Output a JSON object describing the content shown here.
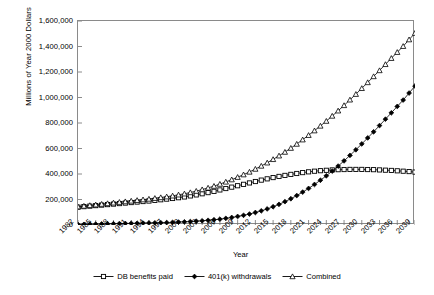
{
  "chart_data": {
    "type": "line",
    "title": "",
    "xlabel": "Year",
    "ylabel": "Millions of Year 2000 Dollars",
    "ylim": [
      0,
      1600000
    ],
    "ytick_step": 200000,
    "ytick_labels": [
      "0",
      "200,000",
      "400,000",
      "600,000",
      "800,000",
      "1,000,000",
      "1,200,000",
      "1,400,000",
      "1,600,000"
    ],
    "ytick_values": [
      0,
      200000,
      400000,
      600000,
      800000,
      1000000,
      1200000,
      1400000,
      1600000
    ],
    "grid": false,
    "legend_position": "bottom",
    "xlim": [
      1982,
      2039
    ],
    "x": [
      1982,
      1983,
      1984,
      1985,
      1986,
      1987,
      1988,
      1989,
      1990,
      1991,
      1992,
      1993,
      1994,
      1995,
      1996,
      1997,
      1998,
      1999,
      2000,
      2001,
      2002,
      2003,
      2004,
      2005,
      2006,
      2007,
      2008,
      2009,
      2010,
      2011,
      2012,
      2013,
      2014,
      2015,
      2016,
      2017,
      2018,
      2019,
      2020,
      2021,
      2022,
      2023,
      2024,
      2025,
      2026,
      2027,
      2028,
      2029,
      2030,
      2031,
      2032,
      2033,
      2034,
      2035,
      2036,
      2037,
      2038,
      2039
    ],
    "xtick_labels": [
      "1982",
      "1985",
      "1988",
      "1991",
      "1994",
      "1997",
      "2000",
      "2003",
      "2006",
      "2009",
      "2012",
      "2015",
      "2018",
      "2021",
      "2024",
      "2027",
      "2030",
      "2033",
      "2036",
      "2039"
    ],
    "xtick_values": [
      1982,
      1985,
      1988,
      1991,
      1994,
      1997,
      2000,
      2003,
      2006,
      2009,
      2012,
      2015,
      2018,
      2021,
      2024,
      2027,
      2030,
      2033,
      2036,
      2039
    ],
    "series": [
      {
        "name": "DB benefits paid",
        "marker": "open-square",
        "color": "#000000",
        "values": [
          140000,
          144000,
          148000,
          152000,
          156000,
          160000,
          164000,
          168000,
          172000,
          176000,
          180000,
          184000,
          188000,
          193000,
          198000,
          203000,
          208000,
          214000,
          220000,
          228000,
          236000,
          245000,
          254000,
          264000,
          275000,
          286000,
          297000,
          308000,
          319000,
          330000,
          341000,
          352000,
          362000,
          372000,
          381000,
          389000,
          397000,
          404000,
          411000,
          417000,
          422000,
          426000,
          429000,
          432000,
          434000,
          435000,
          436000,
          436000,
          436000,
          435000,
          434000,
          432000,
          430000,
          428000,
          425000,
          422000,
          419000,
          415000
        ]
      },
      {
        "name": "401(k) withdrawals",
        "marker": "filled-diamond",
        "color": "#000000",
        "values": [
          4000,
          5000,
          6000,
          7000,
          8000,
          9000,
          10000,
          11000,
          12000,
          13000,
          14000,
          15000,
          16000,
          17000,
          18000,
          19000,
          21000,
          23000,
          25000,
          27000,
          30000,
          33000,
          37000,
          41000,
          46000,
          52000,
          59000,
          67000,
          76000,
          86000,
          98000,
          111000,
          126000,
          143000,
          162000,
          183000,
          206000,
          231000,
          258000,
          287000,
          318000,
          351000,
          386000,
          423000,
          462000,
          503000,
          546000,
          590000,
          636000,
          683000,
          731000,
          780000,
          830000,
          880000,
          930000,
          980000,
          1035000,
          1090000
        ]
      },
      {
        "name": "Combined",
        "marker": "open-triangle",
        "color": "#000000",
        "values": [
          144000,
          149000,
          154000,
          159000,
          164000,
          169000,
          174000,
          179000,
          184000,
          189000,
          194000,
          199000,
          204000,
          210000,
          216000,
          222000,
          229000,
          237000,
          245000,
          255000,
          266000,
          278000,
          291000,
          305000,
          321000,
          338000,
          356000,
          375000,
          395000,
          416000,
          439000,
          463000,
          488000,
          515000,
          543000,
          572000,
          603000,
          635000,
          669000,
          704000,
          740000,
          777000,
          815000,
          855000,
          896000,
          938000,
          982000,
          1026000,
          1072000,
          1118000,
          1165000,
          1212000,
          1260000,
          1308000,
          1355000,
          1402000,
          1454000,
          1505000
        ]
      }
    ]
  },
  "legend": {
    "items": [
      {
        "label": "DB benefits paid"
      },
      {
        "label": "401(k) withdrawals"
      },
      {
        "label": "Combined"
      }
    ]
  }
}
